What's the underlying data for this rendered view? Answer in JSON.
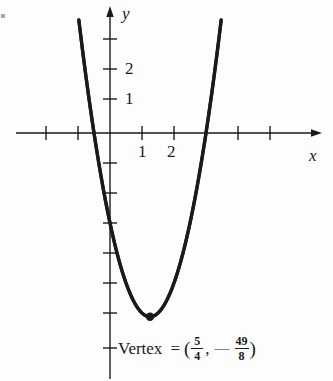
{
  "figure": {
    "kind": "cartesian-graph",
    "background_color": "#fdfdfd",
    "ink_color": "#1a1a1a"
  },
  "axes": {
    "x_label": "x",
    "y_label": "y",
    "origin_px": {
      "x": 110,
      "y": 133
    },
    "unit_px": {
      "x": 32,
      "y": 30
    },
    "x_tick_labels": [
      {
        "text": "1",
        "value": 1
      },
      {
        "text": "2",
        "value": 2
      }
    ],
    "y_tick_labels": [
      {
        "text": "2",
        "value": 2
      },
      {
        "text": "1",
        "value": 1
      }
    ]
  },
  "annotation": {
    "vertex_text": "Vertex",
    "equals": "=",
    "open_paren": "(",
    "close_paren": ")",
    "comma": ",",
    "minus": "—",
    "x_numerator": "5",
    "x_denominator": "4",
    "y_numerator": "49",
    "y_denominator": "8"
  },
  "chart_data": {
    "type": "line",
    "title": "",
    "xlabel": "x",
    "ylabel": "y",
    "grid": false,
    "legend": "none",
    "xlim": [
      -2.9,
      6.2
    ],
    "ylim": [
      -8.4,
      4.0
    ],
    "xticks": [
      -2,
      -1,
      1,
      2,
      3,
      4,
      5
    ],
    "yticks": [
      -7,
      -6,
      -5,
      -4,
      -3,
      -2,
      -1,
      1,
      2,
      3
    ],
    "xtick_labels_shown": [
      "1",
      "2"
    ],
    "ytick_labels_shown": [
      "1",
      "2"
    ],
    "series": [
      {
        "name": "parabola",
        "equation": "y = 2x^2 - 5x - 3",
        "a": 2,
        "b": -5,
        "c": -3,
        "x": [
          -0.9,
          -0.7,
          -0.5,
          -0.3,
          -0.1,
          0.1,
          0.3,
          0.5,
          0.7,
          0.9,
          1.1,
          1.25,
          1.4,
          1.6,
          1.8,
          2.0,
          2.2,
          2.4,
          2.6,
          2.8,
          3.0,
          3.2,
          3.4
        ],
        "values": [
          3.12,
          1.48,
          0.0,
          -1.32,
          -2.48,
          -3.48,
          -4.32,
          -5.0,
          -5.52,
          -5.88,
          -6.08,
          -6.125,
          -6.08,
          -5.88,
          -5.52,
          -5.0,
          -4.32,
          -3.48,
          -2.48,
          -1.32,
          0.0,
          1.48,
          3.12
        ]
      }
    ],
    "points": [
      {
        "name": "vertex",
        "x": 1.25,
        "y": -6.125,
        "label": "Vertex = (5/4, -49/8)",
        "marker": "filled-dot"
      }
    ],
    "roots": [
      -0.5,
      3.0
    ]
  }
}
